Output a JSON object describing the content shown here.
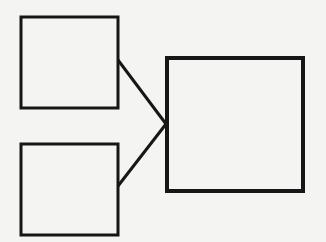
{
  "diagram": {
    "background": "#f4f4f2",
    "stroke_color": "#161616",
    "nodes": [
      {
        "id": "box-top-left",
        "x": 21,
        "y": 17,
        "w": 97,
        "h": 91,
        "stroke_width": 3
      },
      {
        "id": "box-bottom-left",
        "x": 21,
        "y": 144,
        "w": 97,
        "h": 91,
        "stroke_width": 3
      },
      {
        "id": "box-right",
        "x": 167,
        "y": 58,
        "w": 136,
        "h": 133,
        "stroke_width": 4
      }
    ],
    "edges": [
      {
        "from": "box-top-left",
        "to": "box-right",
        "x1": 118,
        "y1": 60,
        "x2": 166,
        "y2": 124
      },
      {
        "from": "box-bottom-left",
        "to": "box-right",
        "x1": 118,
        "y1": 186,
        "x2": 166,
        "y2": 124
      }
    ]
  }
}
